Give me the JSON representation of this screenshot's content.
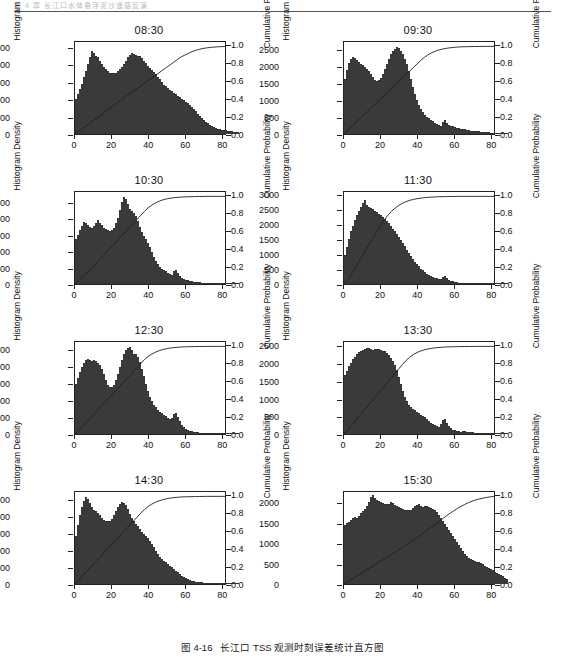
{
  "header": {
    "running_head": "第 4 章 长江口水体悬浮泥沙遥感反演"
  },
  "caption": {
    "number": "图 4-16",
    "text": "长江口 TSS 观测时刻误差统计直方图"
  },
  "axes": {
    "ylabel_left": "Histogram Density",
    "ylabel_right": "Cumulative Probability",
    "xticks": [
      "0",
      "20",
      "40",
      "60",
      "80"
    ],
    "right_yticks": [
      "0.0",
      "0.2",
      "0.4",
      "0.6",
      "0.8",
      "1.0"
    ]
  },
  "chart_data": [
    {
      "type": "bar",
      "title": "08:30",
      "xlabel": "",
      "ylabel": "Histogram Density",
      "ylabel_right": "Cumulative Probability",
      "xlim": [
        0,
        82
      ],
      "ylim": [
        0,
        2700
      ],
      "ylim_right": [
        0,
        1.05
      ],
      "yticks": [
        0,
        500,
        1000,
        1500,
        2000,
        2500
      ],
      "yticks_right": [
        0.0,
        0.2,
        0.4,
        0.6,
        0.8,
        1.0
      ],
      "xticks": [
        0,
        20,
        40,
        60,
        80
      ],
      "grid": false,
      "bin_width": 1,
      "values": [
        1020,
        1180,
        1320,
        1480,
        1680,
        1850,
        2050,
        2250,
        2450,
        2380,
        2300,
        2250,
        2150,
        2050,
        1980,
        1900,
        1850,
        1800,
        1790,
        1780,
        1800,
        1850,
        1900,
        1980,
        2050,
        2150,
        2250,
        2330,
        2380,
        2360,
        2320,
        2300,
        2280,
        2230,
        2150,
        2080,
        2000,
        1940,
        1880,
        1820,
        1750,
        1680,
        1600,
        1520,
        1450,
        1400,
        1350,
        1300,
        1250,
        1200,
        1160,
        1120,
        1080,
        1040,
        1000,
        950,
        900,
        850,
        790,
        730,
        670,
        600,
        540,
        480,
        420,
        360,
        310,
        270,
        230,
        200,
        175,
        155,
        140,
        125,
        115,
        105,
        95,
        88,
        80,
        72,
        65,
        60
      ],
      "cdf": [
        0.0,
        0.03,
        0.06,
        0.09,
        0.12,
        0.15,
        0.18,
        0.21,
        0.25,
        0.28,
        0.31,
        0.34,
        0.37,
        0.4,
        0.43,
        0.46,
        0.49,
        0.52,
        0.55,
        0.58,
        0.61,
        0.64,
        0.67,
        0.7,
        0.73,
        0.76,
        0.79,
        0.82,
        0.85,
        0.88,
        0.9,
        0.92,
        0.94,
        0.955,
        0.967,
        0.976,
        0.983,
        0.988,
        0.992,
        0.995,
        0.997,
        1.0
      ]
    },
    {
      "type": "bar",
      "title": "09:30",
      "xlabel": "",
      "ylabel": "Histogram Density",
      "ylabel_right": "Cumulative Probability",
      "xlim": [
        0,
        82
      ],
      "ylim": [
        0,
        2750
      ],
      "ylim_right": [
        0,
        1.05
      ],
      "yticks": [
        0,
        500,
        1000,
        1500,
        2000,
        2500
      ],
      "yticks_right": [
        0.0,
        0.2,
        0.4,
        0.6,
        0.8,
        1.0
      ],
      "xticks": [
        0,
        20,
        40,
        60,
        80
      ],
      "grid": false,
      "bin_width": 1,
      "values": [
        1650,
        1900,
        2120,
        2250,
        2300,
        2260,
        2200,
        2150,
        2100,
        2050,
        2000,
        1950,
        1880,
        1800,
        1700,
        1620,
        1580,
        1600,
        1680,
        1800,
        1950,
        2100,
        2250,
        2380,
        2480,
        2550,
        2590,
        2560,
        2480,
        2380,
        2250,
        2080,
        1880,
        1650,
        1420,
        1200,
        1020,
        880,
        760,
        660,
        580,
        520,
        470,
        420,
        380,
        340,
        300,
        270,
        250,
        350,
        430,
        330,
        280,
        250,
        225,
        205,
        190,
        175,
        160,
        148,
        135,
        125,
        115,
        105,
        98,
        90,
        82,
        76,
        70,
        64,
        58,
        53,
        49,
        45,
        41,
        38,
        35,
        32,
        30,
        28,
        26,
        24
      ],
      "cdf": [
        0.0,
        0.04,
        0.08,
        0.12,
        0.16,
        0.2,
        0.24,
        0.28,
        0.32,
        0.36,
        0.4,
        0.44,
        0.48,
        0.52,
        0.56,
        0.6,
        0.64,
        0.68,
        0.72,
        0.76,
        0.8,
        0.84,
        0.875,
        0.905,
        0.928,
        0.946,
        0.96,
        0.97,
        0.978,
        0.984,
        0.989,
        0.992,
        0.995,
        0.996,
        0.997,
        0.998,
        0.999,
        0.999,
        1.0,
        1.0,
        1.0,
        1.0
      ]
    },
    {
      "type": "bar",
      "title": "10:30",
      "xlabel": "",
      "ylabel": "Histogram Density",
      "ylabel_right": "Cumulative Probability",
      "xlim": [
        0,
        82
      ],
      "ylim": [
        0,
        2850
      ],
      "ylim_right": [
        0,
        1.05
      ],
      "yticks": [
        0,
        500,
        1000,
        1500,
        2000,
        2500
      ],
      "yticks_right": [
        0.0,
        0.2,
        0.4,
        0.6,
        0.8,
        1.0
      ],
      "xticks": [
        0,
        20,
        40,
        60,
        80
      ],
      "grid": false,
      "bin_width": 1,
      "values": [
        1380,
        1520,
        1680,
        1800,
        1920,
        1880,
        1820,
        1780,
        1750,
        1800,
        1900,
        1980,
        1900,
        1820,
        1750,
        1700,
        1680,
        1650,
        1680,
        1750,
        1880,
        2050,
        2300,
        2550,
        2700,
        2620,
        2480,
        2320,
        2250,
        2200,
        2100,
        1950,
        1780,
        1620,
        1480,
        1380,
        1280,
        1150,
        1000,
        850,
        720,
        620,
        540,
        480,
        430,
        390,
        350,
        320,
        290,
        390,
        420,
        330,
        260,
        200,
        160,
        130,
        110,
        95,
        82,
        72,
        64,
        57,
        51,
        46,
        42,
        38,
        35,
        32,
        29,
        27,
        25,
        23,
        21,
        19,
        18,
        17,
        16,
        15,
        14,
        13,
        12,
        11
      ],
      "cdf": [
        0.0,
        0.04,
        0.08,
        0.12,
        0.16,
        0.2,
        0.245,
        0.29,
        0.335,
        0.38,
        0.425,
        0.47,
        0.515,
        0.56,
        0.605,
        0.65,
        0.695,
        0.74,
        0.785,
        0.83,
        0.87,
        0.9,
        0.925,
        0.945,
        0.96,
        0.971,
        0.979,
        0.985,
        0.989,
        0.992,
        0.994,
        0.996,
        0.997,
        0.998,
        0.999,
        0.999,
        1.0,
        1.0,
        1.0,
        1.0,
        1.0,
        1.0
      ]
    },
    {
      "type": "bar",
      "title": "11:30",
      "xlabel": "",
      "ylabel": "Histogram Density",
      "ylabel_right": "Cumulative Probability",
      "xlim": [
        0,
        82
      ],
      "ylim": [
        0,
        3150
      ],
      "ylim_right": [
        0,
        1.05
      ],
      "yticks": [
        0,
        500,
        1000,
        1500,
        2000,
        2500,
        3000
      ],
      "yticks_right": [
        0.0,
        0.2,
        0.4,
        0.6,
        0.8,
        1.0
      ],
      "xticks": [
        0,
        20,
        40,
        60,
        80
      ],
      "grid": false,
      "bin_width": 1,
      "values": [
        980,
        1280,
        1550,
        1800,
        2000,
        2180,
        2350,
        2500,
        2650,
        2780,
        2880,
        2720,
        2650,
        2600,
        2560,
        2500,
        2450,
        2400,
        2350,
        2300,
        2220,
        2150,
        2080,
        2000,
        1900,
        1800,
        1700,
        1600,
        1500,
        1400,
        1300,
        1180,
        1060,
        950,
        850,
        760,
        680,
        600,
        530,
        470,
        410,
        360,
        320,
        280,
        250,
        220,
        200,
        180,
        165,
        250,
        280,
        200,
        150,
        115,
        90,
        72,
        60,
        50,
        43,
        38,
        33,
        29,
        26,
        23,
        21,
        19,
        17,
        16,
        15,
        14,
        13,
        12,
        11,
        10,
        9,
        9,
        8,
        8,
        7,
        7,
        6,
        6
      ],
      "cdf": [
        0.0,
        0.05,
        0.11,
        0.18,
        0.25,
        0.32,
        0.39,
        0.46,
        0.53,
        0.6,
        0.67,
        0.73,
        0.785,
        0.83,
        0.868,
        0.898,
        0.922,
        0.941,
        0.955,
        0.966,
        0.974,
        0.98,
        0.985,
        0.989,
        0.992,
        0.994,
        0.996,
        0.997,
        0.998,
        0.999,
        0.999,
        1.0,
        1.0,
        1.0,
        1.0,
        1.0,
        1.0,
        1.0,
        1.0,
        1.0,
        1.0,
        1.0
      ]
    },
    {
      "type": "bar",
      "title": "12:30",
      "xlabel": "",
      "ylabel": "Histogram Density",
      "ylabel_right": "Cumulative Probability",
      "xlim": [
        0,
        82
      ],
      "ylim": [
        0,
        2750
      ],
      "ylim_right": [
        0,
        1.05
      ],
      "yticks": [
        0,
        500,
        1000,
        1500,
        2000,
        2500
      ],
      "yticks_right": [
        0.0,
        0.2,
        0.4,
        0.6,
        0.8,
        1.0
      ],
      "xticks": [
        0,
        20,
        40,
        60,
        80
      ],
      "grid": false,
      "bin_width": 1,
      "values": [
        1500,
        1680,
        1850,
        2000,
        2130,
        2220,
        2250,
        2200,
        2180,
        2200,
        2180,
        2120,
        2050,
        1950,
        1800,
        1620,
        1480,
        1400,
        1400,
        1480,
        1620,
        1800,
        2000,
        2220,
        2400,
        2520,
        2580,
        2600,
        2500,
        2400,
        2380,
        2300,
        2150,
        1950,
        1720,
        1500,
        1300,
        1120,
        980,
        880,
        800,
        730,
        670,
        620,
        570,
        530,
        490,
        460,
        480,
        600,
        620,
        500,
        380,
        280,
        210,
        160,
        125,
        100,
        82,
        68,
        58,
        50,
        44,
        39,
        35,
        32,
        29,
        27,
        25,
        23,
        21,
        20,
        18,
        17,
        16,
        15,
        14,
        13,
        12,
        12,
        11,
        10
      ],
      "cdf": [
        0.0,
        0.04,
        0.085,
        0.13,
        0.175,
        0.22,
        0.265,
        0.31,
        0.355,
        0.4,
        0.445,
        0.49,
        0.535,
        0.58,
        0.625,
        0.67,
        0.715,
        0.76,
        0.805,
        0.85,
        0.885,
        0.912,
        0.934,
        0.951,
        0.964,
        0.974,
        0.981,
        0.986,
        0.99,
        0.993,
        0.995,
        0.996,
        0.997,
        0.998,
        0.999,
        0.999,
        1.0,
        1.0,
        1.0,
        1.0,
        1.0,
        1.0
      ]
    },
    {
      "type": "bar",
      "title": "13:30",
      "xlabel": "",
      "ylabel": "Histogram Density",
      "ylabel_right": "Cumulative Probability",
      "xlim": [
        0,
        82
      ],
      "ylim": [
        0,
        2650
      ],
      "ylim_right": [
        0,
        1.05
      ],
      "yticks": [
        0,
        500,
        1000,
        1500,
        2000,
        2500
      ],
      "yticks_right": [
        0.0,
        0.2,
        0.4,
        0.6,
        0.8,
        1.0
      ],
      "xticks": [
        0,
        20,
        40,
        60,
        80
      ],
      "grid": false,
      "bin_width": 1,
      "values": [
        1700,
        1820,
        1950,
        2050,
        2150,
        2230,
        2300,
        2350,
        2400,
        2430,
        2450,
        2470,
        2480,
        2450,
        2430,
        2440,
        2460,
        2450,
        2430,
        2400,
        2380,
        2340,
        2280,
        2200,
        2100,
        1980,
        1830,
        1650,
        1450,
        1250,
        1080,
        950,
        850,
        780,
        720,
        680,
        640,
        600,
        560,
        520,
        480,
        430,
        380,
        330,
        290,
        250,
        220,
        200,
        280,
        400,
        420,
        320,
        230,
        170,
        130,
        105,
        88,
        75,
        72,
        80,
        82,
        72,
        60,
        50,
        44,
        40,
        38,
        36,
        34,
        32,
        30,
        29,
        28,
        27,
        26,
        25,
        24,
        23,
        22,
        21,
        20,
        19
      ],
      "cdf": [
        0.0,
        0.045,
        0.095,
        0.145,
        0.195,
        0.245,
        0.295,
        0.345,
        0.395,
        0.445,
        0.495,
        0.545,
        0.595,
        0.645,
        0.695,
        0.745,
        0.795,
        0.84,
        0.878,
        0.908,
        0.93,
        0.948,
        0.961,
        0.971,
        0.978,
        0.984,
        0.988,
        0.991,
        0.993,
        0.995,
        0.996,
        0.997,
        0.998,
        0.998,
        0.999,
        0.999,
        1.0,
        1.0,
        1.0,
        1.0,
        1.0,
        1.0
      ]
    },
    {
      "type": "bar",
      "title": "14:30",
      "xlabel": "",
      "ylabel": "Histogram Density",
      "ylabel_right": "Cumulative Probability",
      "xlim": [
        0,
        82
      ],
      "ylim": [
        0,
        2750
      ],
      "ylim_right": [
        0,
        1.05
      ],
      "yticks": [
        0,
        500,
        1000,
        1500,
        2000,
        2500
      ],
      "yticks_right": [
        0.0,
        0.2,
        0.4,
        0.6,
        0.8,
        1.0
      ],
      "xticks": [
        0,
        20,
        40,
        60,
        80
      ],
      "grid": false,
      "bin_width": 1,
      "values": [
        1450,
        1750,
        2050,
        2300,
        2480,
        2600,
        2550,
        2420,
        2300,
        2220,
        2180,
        2120,
        2050,
        1980,
        1920,
        1880,
        1870,
        1890,
        1950,
        2050,
        2180,
        2300,
        2400,
        2450,
        2430,
        2350,
        2230,
        2100,
        1980,
        1880,
        1800,
        1720,
        1640,
        1560,
        1500,
        1450,
        1380,
        1300,
        1200,
        1100,
        1000,
        900,
        820,
        760,
        700,
        650,
        600,
        550,
        500,
        450,
        400,
        350,
        300,
        250,
        210,
        175,
        145,
        120,
        100,
        85,
        72,
        62,
        54,
        48,
        43,
        38,
        34,
        31,
        28,
        26,
        24,
        22,
        20,
        19,
        18,
        17,
        16,
        15,
        14,
        13,
        12,
        11
      ],
      "cdf": [
        0.0,
        0.045,
        0.09,
        0.135,
        0.18,
        0.225,
        0.27,
        0.315,
        0.36,
        0.405,
        0.45,
        0.495,
        0.54,
        0.585,
        0.63,
        0.675,
        0.72,
        0.765,
        0.81,
        0.85,
        0.885,
        0.912,
        0.933,
        0.95,
        0.963,
        0.973,
        0.98,
        0.986,
        0.99,
        0.993,
        0.995,
        0.996,
        0.997,
        0.998,
        0.999,
        0.999,
        1.0,
        1.0,
        1.0,
        1.0,
        1.0,
        1.0
      ]
    },
    {
      "type": "bar",
      "title": "15:30",
      "xlabel": "",
      "ylabel": "Histogram Density",
      "ylabel_right": "Cumulative Probability",
      "xlim": [
        0,
        82
      ],
      "ylim": [
        0,
        2300
      ],
      "ylim_right": [
        0,
        1.05
      ],
      "yticks": [
        0,
        500,
        1000,
        1500,
        2000
      ],
      "yticks_right": [
        0.0,
        0.2,
        0.4,
        0.6,
        0.8,
        1.0
      ],
      "xticks": [
        0,
        20,
        40,
        60,
        80
      ],
      "grid": false,
      "bin_width": 1,
      "values": [
        1480,
        1520,
        1560,
        1600,
        1640,
        1680,
        1660,
        1700,
        1780,
        1820,
        1880,
        1950,
        2050,
        2180,
        2220,
        2150,
        2100,
        2080,
        2040,
        2020,
        2000,
        1990,
        2010,
        2050,
        2030,
        1980,
        1950,
        1930,
        1900,
        1880,
        1860,
        1850,
        1840,
        1860,
        1900,
        1950,
        1980,
        1990,
        1960,
        1930,
        1940,
        1950,
        1930,
        1900,
        1880,
        1850,
        1800,
        1720,
        1650,
        1580,
        1500,
        1420,
        1350,
        1280,
        1200,
        1120,
        1050,
        980,
        900,
        830,
        760,
        700,
        660,
        620,
        600,
        580,
        560,
        540,
        520,
        490,
        460,
        430,
        400,
        370,
        340,
        310,
        280,
        250,
        220,
        190,
        160,
        130
      ],
      "cdf": [
        0.0,
        0.026,
        0.052,
        0.078,
        0.104,
        0.13,
        0.156,
        0.182,
        0.208,
        0.234,
        0.26,
        0.286,
        0.312,
        0.338,
        0.364,
        0.39,
        0.418,
        0.446,
        0.474,
        0.502,
        0.53,
        0.56,
        0.59,
        0.62,
        0.65,
        0.682,
        0.714,
        0.746,
        0.778,
        0.808,
        0.836,
        0.862,
        0.886,
        0.908,
        0.928,
        0.945,
        0.959,
        0.971,
        0.98,
        0.988,
        0.994,
        1.0
      ]
    }
  ]
}
